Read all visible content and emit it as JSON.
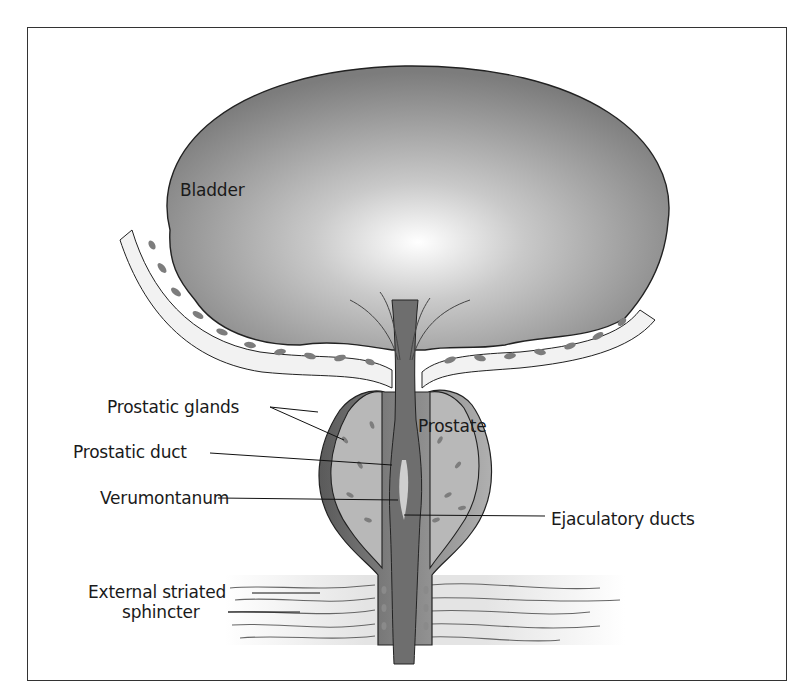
{
  "figure": {
    "type": "anatomical-diagram",
    "labels": {
      "bladder": "Bladder",
      "prostate": "Prostate",
      "prostatic_glands": "Prostatic glands",
      "prostatic_duct": "Prostatic duct",
      "verumontanum": "Verumontanum",
      "ejaculatory_ducts": "Ejaculatory ducts",
      "sphincter_line1": "External striated",
      "sphincter_line2": "sphincter"
    },
    "colors": {
      "bladder_dark": "#7a7a7a",
      "bladder_light": "#ffffff",
      "tissue": "#b8b8b8",
      "urethra": "#6e6e6e",
      "outline": "#222222",
      "fleck": "#7d7d7d",
      "frame": "#333333"
    }
  }
}
